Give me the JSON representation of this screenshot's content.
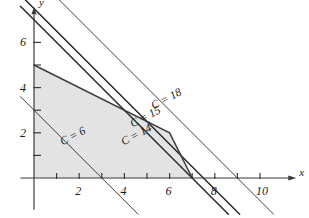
{
  "figure": {
    "axis_x_label": "x",
    "axis_y_label": "y",
    "background": "#ffffff",
    "region_fill": "#e3e3e3",
    "line_color": "#2b2b2b",
    "axis_color": "#3a3a3a"
  },
  "axes": {
    "x_ticks": [
      1,
      2,
      3,
      4,
      5,
      6,
      7,
      8,
      9,
      10
    ],
    "x_tick_labels": [
      "",
      "2",
      "",
      "4",
      "",
      "6",
      "",
      "8",
      "",
      "10"
    ],
    "y_ticks": [
      1,
      2,
      3,
      4,
      5,
      6
    ],
    "y_tick_labels": [
      "",
      "2",
      "",
      "4",
      "",
      "6"
    ],
    "xlim": [
      -0.6,
      11.6
    ],
    "ylim": [
      -1.4,
      7.6
    ]
  },
  "labels": {
    "c18": "C = 18",
    "c15": "C = 15",
    "c14": "C = 14",
    "c6": "C = 6"
  },
  "chart_data": {
    "type": "line",
    "title": "",
    "xlabel": "x",
    "ylabel": "y",
    "xlim": [
      -0.6,
      11.6
    ],
    "ylim": [
      -1.4,
      7.6
    ],
    "grid": false,
    "legend": "none",
    "x_ticks": [
      1,
      2,
      3,
      4,
      5,
      6,
      7,
      8,
      9,
      10
    ],
    "x_tick_labels": [
      "",
      "2",
      "",
      "4",
      "",
      "6",
      "",
      "8",
      "",
      "10"
    ],
    "y_ticks": [
      1,
      2,
      3,
      4,
      5,
      6
    ],
    "y_tick_labels": [
      "",
      "2",
      "",
      "4",
      "",
      "6"
    ],
    "feasible_region": {
      "name": "feasible region",
      "fill": "#e3e3e3",
      "vertices": [
        [
          0,
          0
        ],
        [
          0,
          5
        ],
        [
          6,
          2
        ],
        [
          7,
          0
        ]
      ]
    },
    "series": [
      {
        "name": "C = 6",
        "type": "objective-line",
        "slope": -1.0,
        "intercept": 3.0,
        "points": [
          [
            -0.6,
            3.6
          ],
          [
            4.6,
            -1.6
          ]
        ],
        "annotation": "C = 6"
      },
      {
        "name": "C = 14",
        "type": "objective-line",
        "slope": -1.0,
        "intercept": 7.0,
        "points": [
          [
            -0.6,
            7.6
          ],
          [
            8.6,
            -1.6
          ]
        ],
        "annotation": "C = 14"
      },
      {
        "name": "C = 15",
        "type": "objective-line",
        "slope": -1.0,
        "intercept": 7.5,
        "points": [
          [
            -0.6,
            8.1
          ],
          [
            9.1,
            -1.6
          ]
        ],
        "annotation": "C = 15"
      },
      {
        "name": "C = 18",
        "type": "objective-line",
        "slope": -1.0,
        "intercept": 9.0,
        "points": [
          [
            -0.6,
            9.6
          ],
          [
            10.6,
            -1.6
          ]
        ],
        "annotation": "C = 18"
      }
    ],
    "annotations": [
      {
        "text": "C = 18",
        "x": 5.2,
        "y": 3.15,
        "rotation": -28
      },
      {
        "text": "C = 15",
        "x": 4.3,
        "y": 2.35,
        "rotation": -28
      },
      {
        "text": "C = 14",
        "x": 3.9,
        "y": 1.55,
        "rotation": -28
      },
      {
        "text": "C = 6",
        "x": 1.2,
        "y": 1.55,
        "rotation": -28
      }
    ]
  }
}
